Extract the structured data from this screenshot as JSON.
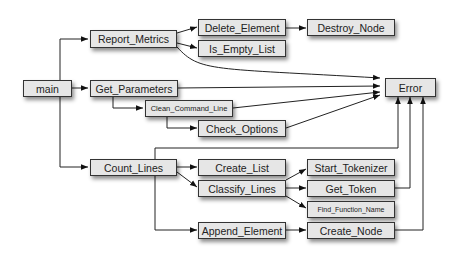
{
  "diagram": {
    "type": "call-graph",
    "nodes": {
      "main": "main",
      "report_metrics": "Report_Metrics",
      "delete_element": "Delete_Element",
      "destroy_node": "Destroy_Node",
      "is_empty_list": "Is_Empty_List",
      "get_parameters": "Get_Parameters",
      "clean_command_line": "Clean_Command_Line",
      "check_options": "Check_Options",
      "error": "Error",
      "count_lines": "Count_Lines",
      "create_list": "Create_List",
      "classify_lines": "Classify_Lines",
      "start_tokenizer": "Start_Tokenizer",
      "get_token": "Get_Token",
      "find_function_name": "Find_Function_Name",
      "append_element": "Append_Element",
      "create_node": "Create_Node"
    },
    "edges": [
      [
        "main",
        "Report_Metrics"
      ],
      [
        "main",
        "Get_Parameters"
      ],
      [
        "main",
        "Count_Lines"
      ],
      [
        "Report_Metrics",
        "Delete_Element"
      ],
      [
        "Report_Metrics",
        "Is_Empty_List"
      ],
      [
        "Report_Metrics",
        "Error"
      ],
      [
        "Delete_Element",
        "Destroy_Node"
      ],
      [
        "Get_Parameters",
        "Error"
      ],
      [
        "Get_Parameters",
        "Clean_Command_Line"
      ],
      [
        "Clean_Command_Line",
        "Check_Options"
      ],
      [
        "Clean_Command_Line",
        "Error"
      ],
      [
        "Check_Options",
        "Error"
      ],
      [
        "Count_Lines",
        "Create_List"
      ],
      [
        "Count_Lines",
        "Classify_Lines"
      ],
      [
        "Count_Lines",
        "Append_Element"
      ],
      [
        "Count_Lines",
        "Error"
      ],
      [
        "Classify_Lines",
        "Start_Tokenizer"
      ],
      [
        "Classify_Lines",
        "Get_Token"
      ],
      [
        "Classify_Lines",
        "Find_Function_Name"
      ],
      [
        "Get_Token",
        "Error"
      ],
      [
        "Append_Element",
        "Create_Node"
      ],
      [
        "Create_Node",
        "Error"
      ]
    ]
  }
}
